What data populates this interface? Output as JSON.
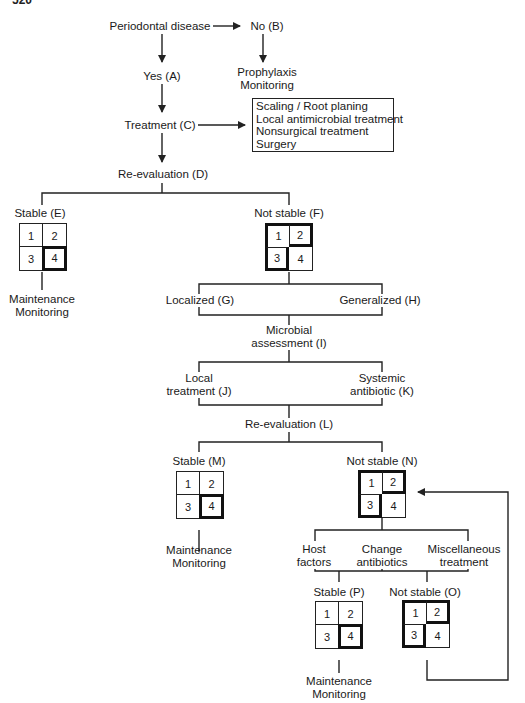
{
  "page_number": "520",
  "nodes": {
    "periodontal_disease": "Periodontal disease",
    "no_b": "No (B)",
    "yes_a": "Yes (A)",
    "prophylaxis": [
      "Prophylaxis",
      "Monitoring"
    ],
    "treatment_c": "Treatment (C)",
    "treatment_options": [
      "Scaling / Root planing",
      "Local antimicrobial treatment",
      "Nonsurgical treatment",
      "Surgery"
    ],
    "reeval_d": "Re-evaluation (D)",
    "stable_e": "Stable (E)",
    "not_stable_f": "Not stable (F)",
    "maintenance_e": [
      "Maintenance",
      "Monitoring"
    ],
    "localized_g": "Localized (G)",
    "generalized_h": "Generalized (H)",
    "microbial_i": [
      "Microbial",
      "assessment (I)"
    ],
    "local_j": [
      "Local",
      "treatment (J)"
    ],
    "systemic_k": [
      "Systemic",
      "antibiotic (K)"
    ],
    "reeval_l": "Re-evaluation (L)",
    "stable_m": "Stable (M)",
    "not_stable_n": "Not stable (N)",
    "maintenance_m": [
      "Maintenance",
      "Monitoring"
    ],
    "host_factors": [
      "Host",
      "factors"
    ],
    "change_antibiotics": [
      "Change",
      "antibiotics"
    ],
    "misc_treatment": [
      "Miscellaneous",
      "treatment"
    ],
    "stable_p": "Stable (P)",
    "not_stable_o": "Not stable (O)",
    "maintenance_p": [
      "Maintenance",
      "Monitoring"
    ]
  },
  "quadrant_grid": {
    "cells": [
      "1",
      "2",
      "3",
      "4"
    ],
    "stable_highlight": "cell 4 bold",
    "not_stable_highlight": "cells 1,2,3 bold outline"
  },
  "colors": {
    "line": "#222222",
    "text": "#1a1a1a",
    "background": "#ffffff"
  }
}
